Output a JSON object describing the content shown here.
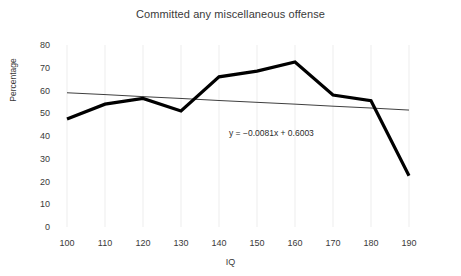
{
  "chart_data": {
    "type": "line",
    "title": "Committed any miscellaneous offense",
    "xlabel": "IQ",
    "ylabel": "Percentage",
    "x": [
      100,
      110,
      120,
      130,
      140,
      150,
      160,
      170,
      180,
      190
    ],
    "xtick_labels": [
      "100",
      "110",
      "120",
      "130",
      "140",
      "150",
      "160",
      "170",
      "180",
      "190"
    ],
    "ytick_labels": [
      "0",
      "10",
      "20",
      "30",
      "40",
      "50",
      "60",
      "70",
      "80"
    ],
    "ytick_values": [
      0,
      10,
      20,
      30,
      40,
      50,
      60,
      70,
      80
    ],
    "xlim": [
      100,
      190
    ],
    "ylim": [
      0,
      80
    ],
    "grid": "vertical-light",
    "legend": "none",
    "series": [
      {
        "name": "Committed any miscellaneous offense",
        "type": "line",
        "color": "#000000",
        "width": 3.2,
        "values": [
          47.5,
          54.0,
          56.5,
          51.0,
          66.0,
          68.5,
          72.5,
          58.0,
          55.5,
          22.5
        ]
      },
      {
        "name": "Linear trendline",
        "type": "trendline",
        "color": "#3f3f3f",
        "width": 1.0,
        "values": [
          59.0,
          58.2,
          57.3,
          56.5,
          55.6,
          54.8,
          54.0,
          53.1,
          52.3,
          51.4
        ]
      }
    ],
    "annotations": [
      {
        "name": "trendline-equation",
        "text": "y = −0.0081x + 0.6003",
        "x": 160,
        "y": 41
      }
    ]
  }
}
